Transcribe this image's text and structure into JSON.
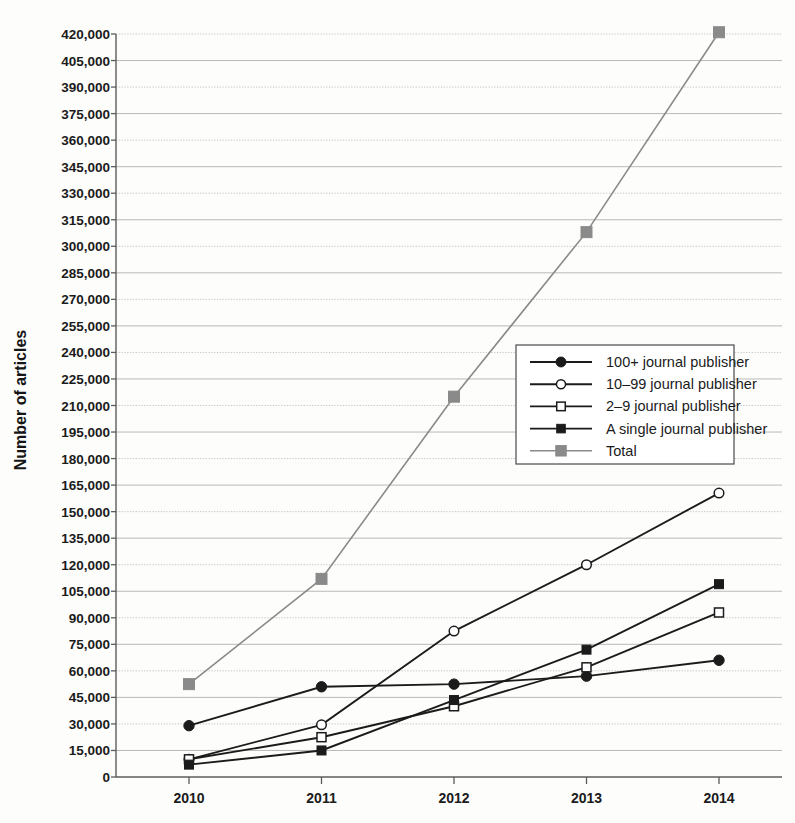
{
  "chart_data": {
    "type": "line",
    "title": "",
    "subtitle": "",
    "xlabel": "",
    "ylabel": "Number of articles",
    "x": [
      2010,
      2011,
      2012,
      2013,
      2014
    ],
    "categories": [
      "2010",
      "2011",
      "2012",
      "2013",
      "2014"
    ],
    "xtick_labels": [
      "2010",
      "2011",
      "2012",
      "2013",
      "2014"
    ],
    "ytick_labels": [
      "0",
      "15,000",
      "30,000",
      "45,000",
      "60,000",
      "75,000",
      "90,000",
      "105,000",
      "120,000",
      "135,000",
      "150,000",
      "165,000",
      "180,000",
      "195,000",
      "210,000",
      "225,000",
      "240,000",
      "255,000",
      "270,000",
      "285,000",
      "300,000",
      "315,000",
      "330,000",
      "345,000",
      "360,000",
      "375,000",
      "390,000",
      "405,000",
      "420,000"
    ],
    "ytick_values": [
      0,
      15000,
      30000,
      45000,
      60000,
      75000,
      90000,
      105000,
      120000,
      135000,
      150000,
      165000,
      180000,
      195000,
      210000,
      225000,
      240000,
      255000,
      270000,
      285000,
      300000,
      315000,
      330000,
      345000,
      360000,
      375000,
      390000,
      405000,
      420000
    ],
    "ylim": [
      0,
      420000
    ],
    "xlim": [
      2010,
      2014
    ],
    "ytick_step": 15000,
    "grid": true,
    "grid_axis": "y",
    "legend_position": "center-right",
    "series": [
      {
        "name": "100+ journal publisher",
        "legend_label": "100+ journal publisher",
        "marker": "filled-circle",
        "color": "#1b1b1b",
        "values": [
          29000,
          51000,
          52500,
          57000,
          66000
        ]
      },
      {
        "name": "10-99 journal publisher",
        "legend_label": "10–99 journal publisher",
        "marker": "open-circle",
        "color": "#1b1b1b",
        "values": [
          10000,
          29500,
          82500,
          120000,
          160500
        ]
      },
      {
        "name": "2-9 journal publisher",
        "legend_label": "2–9 journal publisher",
        "marker": "open-square",
        "color": "#1b1b1b",
        "values": [
          10000,
          22500,
          40000,
          62000,
          93000
        ]
      },
      {
        "name": "A single journal publisher",
        "legend_label": "A single journal publisher",
        "marker": "filled-square",
        "color": "#1b1b1b",
        "values": [
          7000,
          15000,
          43500,
          72000,
          109000
        ]
      },
      {
        "name": "Total",
        "legend_label": "Total",
        "marker": "filled-square-gray",
        "color": "#8a8a8a",
        "values": [
          52500,
          112000,
          215000,
          308000,
          421000
        ]
      }
    ]
  },
  "legend": {
    "entries": [
      "100+ journal publisher",
      "10–99 journal publisher",
      "2–9 journal publisher",
      "A single journal publisher",
      "Total"
    ]
  },
  "axes": {
    "y_title": "Number of articles"
  }
}
